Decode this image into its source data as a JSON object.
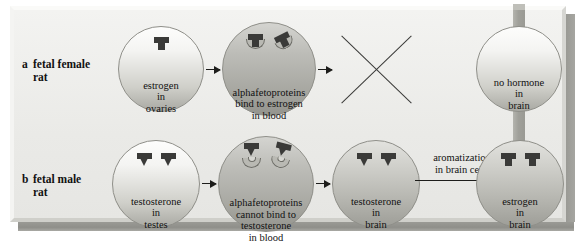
{
  "figure": {
    "rows": [
      {
        "letter": "a",
        "label_line1": "fetal female",
        "label_line2": "rat",
        "nodes": [
          {
            "id": "estrogen-ovaries",
            "line1": "estrogen",
            "line2": "in",
            "line3": "ovaries",
            "icon": "estrogen-molecule"
          },
          {
            "id": "afp-bind",
            "line1": "alphafetoproteins",
            "line2": "bind to estrogen",
            "line3": "in blood",
            "icon": "estrogen-bound-to-alphafetoprotein"
          },
          {
            "id": "no-hormone-brain",
            "line1": "no hormone",
            "line2": "in",
            "line3": "brain",
            "icon": "none"
          }
        ],
        "blocked_marker": "x-cross"
      },
      {
        "letter": "b",
        "label_line1": "fetal male",
        "label_line2": "rat",
        "nodes": [
          {
            "id": "testosterone-testes",
            "line1": "testosterone",
            "line2": "in",
            "line3": "testes",
            "icon": "testosterone-molecule"
          },
          {
            "id": "afp-cannot-bind",
            "line1": "alphafetoproteins",
            "line2": "cannot bind to",
            "line3": "testosterone",
            "line4": "in blood",
            "icon": "testosterone-unbound-alphafetoprotein"
          },
          {
            "id": "testosterone-brain",
            "line1": "testosterone",
            "line2": "in",
            "line3": "brain",
            "icon": "testosterone-molecule"
          },
          {
            "id": "estrogen-brain",
            "line1": "estrogen",
            "line2": "in",
            "line3": "brain",
            "icon": "estrogen-molecule"
          }
        ],
        "arrow_label_line1": "aromatization",
        "arrow_label_line2": "in brain cells"
      }
    ],
    "colors": {
      "panel_background": "#eaeae7",
      "molecule": "#3a3a38",
      "receptor": "#b9b9b3",
      "bar": "#9a9a94",
      "outline": "#8f8f89"
    }
  }
}
